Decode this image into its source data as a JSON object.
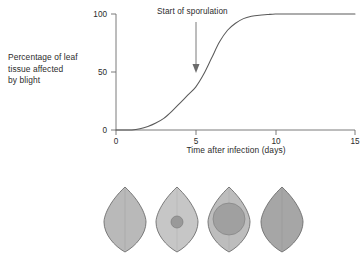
{
  "figure": {
    "background_color": "#ffffff",
    "line_color": "#5a5a5a",
    "text_color": "#2b2b2b"
  },
  "y_axis": {
    "title_lines": [
      "Percentage of leaf",
      "tissue affected",
      "by blight"
    ],
    "ticks": [
      "0",
      "50",
      "100"
    ],
    "tick_values": [
      0,
      50,
      100
    ],
    "min": 0,
    "max": 100
  },
  "x_axis": {
    "title": "Time after infection (days)",
    "ticks": [
      "0",
      "5",
      "10",
      "15"
    ],
    "tick_values": [
      0,
      5,
      10,
      15
    ],
    "min": 0,
    "max": 15
  },
  "annotation": {
    "label": "Start of sporulation",
    "x_value": 5,
    "arrow_from_y": 100,
    "arrow_to_y": 50
  },
  "chart_data": {
    "type": "line",
    "title": "",
    "subtitle": "",
    "xlabel": "Time after infection (days)",
    "ylabel": "Percentage of leaf tissue affected by blight",
    "xlim": [
      0,
      15
    ],
    "ylim": [
      0,
      100
    ],
    "grid": false,
    "legend": "none",
    "xticks": [
      0,
      5,
      10,
      15
    ],
    "yticks": [
      0,
      50,
      100
    ],
    "annotations": [
      {
        "text": "Start of sporulation",
        "x": 5,
        "y": 50,
        "arrow": "down"
      }
    ],
    "series": [
      {
        "name": "Blight progression",
        "x": [
          0.0,
          0.5,
          1.0,
          1.5,
          2.0,
          2.5,
          3.0,
          3.5,
          4.0,
          4.5,
          5.0,
          5.5,
          6.0,
          6.5,
          7.0,
          7.5,
          8.0,
          8.5,
          9.0,
          9.5,
          10.0,
          11.0,
          12.0,
          13.0,
          14.0,
          15.0
        ],
        "y": [
          0,
          0,
          0,
          1,
          3,
          6,
          10,
          16,
          23,
          30,
          37,
          48,
          62,
          76,
          86,
          92,
          96,
          98,
          99,
          99.5,
          100,
          100,
          100,
          100,
          100,
          100
        ]
      }
    ]
  },
  "leaf_diagrams": {
    "count": 4,
    "stages": [
      {
        "name": "healthy-leaf",
        "leaf_color": "#b9b9b9",
        "lesion_color": null,
        "lesion_radius_x": 0,
        "lesion_radius_y": 0,
        "description": "Healthy leaf, no lesion"
      },
      {
        "name": "early-lesion-leaf",
        "leaf_color": "#c6c6c6",
        "lesion_color": "#999999",
        "lesion_radius_x": 6,
        "lesion_radius_y": 6,
        "description": "Small central lesion"
      },
      {
        "name": "expanding-lesion-leaf",
        "leaf_color": "#bdbdbd",
        "lesion_color": "#a0a0a0",
        "lesion_radius_x": 16,
        "lesion_radius_y": 16,
        "description": "Large expanding lesion"
      },
      {
        "name": "fully-blighted-leaf",
        "leaf_color": "#a6a6a6",
        "lesion_color": null,
        "lesion_radius_x": 0,
        "lesion_radius_y": 0,
        "description": "Leaf fully blighted"
      }
    ]
  }
}
